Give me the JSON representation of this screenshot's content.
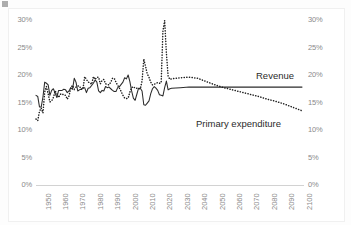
{
  "chart_data": {
    "type": "line",
    "title": "",
    "xlabel": "",
    "ylabel": "",
    "xlim": [
      1947,
      2100
    ],
    "ylim": [
      0,
      30
    ],
    "grid": false,
    "legend_position": "inline-annotation",
    "y_axis_left": {
      "ticks": [
        "0%",
        "5%",
        "10%",
        "15%",
        "20%",
        "25%",
        "30%"
      ],
      "values": [
        0,
        5,
        10,
        15,
        20,
        25,
        30
      ]
    },
    "y_axis_right": {
      "ticks": [
        "0%",
        "5%",
        "10%",
        "15%",
        "20%",
        "25%",
        "30%"
      ],
      "values": [
        0,
        5,
        10,
        15,
        20,
        25,
        30
      ]
    },
    "x_ticks": [
      "1950",
      "1960",
      "1970",
      "1980",
      "1990",
      "2000",
      "2010",
      "2020",
      "2030",
      "2040",
      "2050",
      "2060",
      "2070",
      "2080",
      "2090",
      "2100"
    ],
    "x_tick_values": [
      1950,
      1960,
      1970,
      1980,
      1990,
      2000,
      2010,
      2020,
      2030,
      2040,
      2050,
      2060,
      2070,
      2080,
      2090,
      2100
    ],
    "annotations": [
      {
        "text": "Revenue",
        "x": 2075,
        "y": 19.3
      },
      {
        "text": "Primary expenditure",
        "x": 2038,
        "y": 11.6
      }
    ],
    "series": [
      {
        "name": "Revenue",
        "style": "solid",
        "color": "#2b2b2b",
        "x": [
          1947,
          1948,
          1949,
          1950,
          1951,
          1952,
          1953,
          1954,
          1955,
          1956,
          1957,
          1958,
          1959,
          1960,
          1961,
          1962,
          1963,
          1964,
          1965,
          1966,
          1967,
          1968,
          1969,
          1970,
          1971,
          1972,
          1973,
          1974,
          1975,
          1976,
          1977,
          1978,
          1979,
          1980,
          1981,
          1982,
          1983,
          1984,
          1985,
          1986,
          1987,
          1988,
          1989,
          1990,
          1991,
          1992,
          1993,
          1994,
          1995,
          1996,
          1997,
          1998,
          1999,
          2000,
          2001,
          2002,
          2003,
          2004,
          2005,
          2006,
          2007,
          2008,
          2009,
          2010,
          2011,
          2012,
          2013,
          2014,
          2015,
          2016,
          2017,
          2018,
          2019,
          2020,
          2021,
          2022,
          2023,
          2024,
          2025,
          2030,
          2035,
          2040,
          2045,
          2050,
          2055,
          2060,
          2065,
          2070,
          2075,
          2080,
          2085,
          2090,
          2095,
          2100
        ],
        "y": [
          16.3,
          16.1,
          14.2,
          14.2,
          16.0,
          18.7,
          18.5,
          18.2,
          16.3,
          17.2,
          17.5,
          16.7,
          15.9,
          17.2,
          17.2,
          17.2,
          17.4,
          17.3,
          16.8,
          17.1,
          17.7,
          17.4,
          19.4,
          18.7,
          17.1,
          17.3,
          17.4,
          17.7,
          17.7,
          16.8,
          17.6,
          17.7,
          18.1,
          18.5,
          19.1,
          18.7,
          17.1,
          16.8,
          17.2,
          17.1,
          17.9,
          17.7,
          17.8,
          17.5,
          17.2,
          17.0,
          17.0,
          17.7,
          17.9,
          18.3,
          18.7,
          19.5,
          19.3,
          20.0,
          18.8,
          17.1,
          15.8,
          15.4,
          16.5,
          17.6,
          17.6,
          17.1,
          14.6,
          14.5,
          14.9,
          15.3,
          16.6,
          17.5,
          17.9,
          17.6,
          17.2,
          16.4,
          16.3,
          16.2,
          17.7,
          18.9,
          17.3,
          17.5,
          17.6,
          17.7,
          17.8,
          17.8,
          17.8,
          17.8,
          17.8,
          17.8,
          17.8,
          17.8,
          17.8,
          17.8,
          17.8,
          17.8,
          17.8,
          17.8
        ]
      },
      {
        "name": "Primary expenditure",
        "style": "dotted",
        "color": "#1f1f1f",
        "x": [
          1947,
          1948,
          1949,
          1950,
          1951,
          1952,
          1953,
          1954,
          1955,
          1956,
          1957,
          1958,
          1959,
          1960,
          1961,
          1962,
          1963,
          1964,
          1965,
          1966,
          1967,
          1968,
          1969,
          1970,
          1971,
          1972,
          1973,
          1974,
          1975,
          1976,
          1977,
          1978,
          1979,
          1980,
          1981,
          1982,
          1983,
          1984,
          1985,
          1986,
          1987,
          1988,
          1989,
          1990,
          1991,
          1992,
          1993,
          1994,
          1995,
          1996,
          1997,
          1998,
          1999,
          2000,
          2001,
          2002,
          2003,
          2004,
          2005,
          2006,
          2007,
          2008,
          2009,
          2010,
          2011,
          2012,
          2013,
          2014,
          2015,
          2016,
          2017,
          2018,
          2019,
          2020,
          2021,
          2022,
          2023,
          2024,
          2025,
          2030,
          2035,
          2040,
          2045,
          2050,
          2055,
          2060,
          2065,
          2070,
          2075,
          2080,
          2085,
          2090,
          2095,
          2100
        ],
        "y": [
          12.0,
          11.7,
          13.4,
          14.0,
          13.1,
          16.9,
          17.9,
          16.6,
          15.1,
          15.3,
          15.9,
          17.1,
          16.6,
          15.9,
          16.5,
          16.6,
          16.3,
          16.3,
          15.6,
          16.2,
          17.7,
          18.1,
          17.4,
          17.8,
          18.0,
          18.0,
          17.4,
          17.4,
          19.7,
          19.2,
          18.7,
          18.6,
          18.3,
          19.7,
          19.2,
          19.6,
          19.6,
          18.4,
          19.0,
          19.2,
          18.4,
          18.3,
          18.2,
          18.7,
          19.4,
          19.4,
          18.7,
          18.1,
          17.6,
          17.0,
          16.3,
          15.8,
          15.7,
          15.8,
          16.9,
          17.7,
          17.9,
          17.6,
          17.6,
          17.5,
          17.5,
          18.9,
          22.9,
          21.6,
          20.2,
          19.6,
          18.7,
          18.2,
          18.3,
          18.5,
          18.6,
          18.5,
          18.6,
          28.0,
          29.9,
          24.0,
          19.8,
          19.2,
          19.3,
          19.5,
          19.6,
          19.4,
          18.8,
          18.2,
          17.7,
          17.3,
          16.9,
          16.5,
          16.1,
          15.6,
          15.2,
          14.7,
          14.1,
          13.5
        ]
      }
    ]
  }
}
